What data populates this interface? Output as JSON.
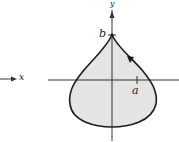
{
  "diagram": {
    "type": "teardrop-curve",
    "axes": {
      "x_label": "x",
      "y_label": "y"
    },
    "ticks": {
      "a_label": "a",
      "b_label": "b"
    },
    "colors": {
      "fill": "#e4e4e4",
      "stroke": "#1a1a1a",
      "axis": "#333333"
    },
    "fragment": {
      "x_label": "x"
    }
  }
}
